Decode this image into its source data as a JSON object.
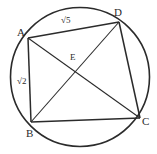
{
  "figure": {
    "kind": "cyclic-quadrilateral-in-circle",
    "background_color": "#ffffff",
    "stroke_color": "#2b2b2b",
    "canvas": {
      "width": 157,
      "height": 154
    },
    "circle": {
      "cx": 80,
      "cy": 77,
      "r": 69.5
    },
    "vertices": {
      "A": {
        "label": "A",
        "x": 28,
        "y": 38,
        "label_x": 17,
        "label_y": 27
      },
      "B": {
        "label": "B",
        "x": 31,
        "y": 122,
        "label_x": 26,
        "label_y": 128
      },
      "C": {
        "label": "C",
        "x": 140,
        "y": 118,
        "label_x": 142,
        "label_y": 116
      },
      "D": {
        "label": "D",
        "x": 119,
        "y": 22,
        "label_x": 114,
        "label_y": 7
      },
      "E": {
        "label": "E",
        "x": 76,
        "y": 70,
        "label_x": 70,
        "label_y": 53
      }
    },
    "edges": [
      {
        "name": "AD",
        "from": "A",
        "to": "D"
      },
      {
        "name": "DC",
        "from": "D",
        "to": "C"
      },
      {
        "name": "CB",
        "from": "C",
        "to": "B"
      },
      {
        "name": "BA",
        "from": "B",
        "to": "A"
      }
    ],
    "diagonals": [
      {
        "name": "AC",
        "from": "A",
        "to": "C"
      },
      {
        "name": "BD",
        "from": "B",
        "to": "D"
      }
    ],
    "side_labels": [
      {
        "name": "AD-length",
        "text": "√5",
        "x": 61,
        "y": 16
      },
      {
        "name": "AB-length",
        "text": "√2",
        "x": 17,
        "y": 77
      }
    ]
  }
}
